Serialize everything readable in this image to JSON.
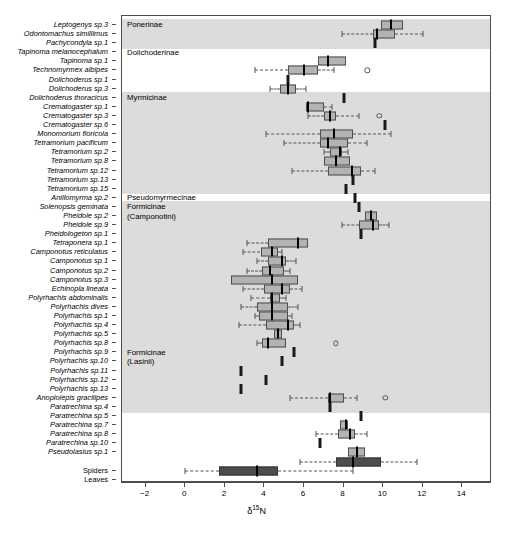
{
  "axis": {
    "x_title": "N",
    "x_title_prefix": "δ",
    "x_title_sup": "15",
    "x_ticks": [
      -2,
      0,
      2,
      4,
      6,
      8,
      10,
      12,
      14
    ],
    "x_tick_labels": [
      "−2",
      "0",
      "2",
      "4",
      "6",
      "8",
      "10",
      "12",
      "14"
    ],
    "x_min": -3.2,
    "x_max": 15.5
  },
  "groups": [
    {
      "name": "Ponerinae",
      "label": "Ponerinae",
      "shaded": true,
      "start": 0,
      "end": 2
    },
    {
      "name": "Dolichoderinae",
      "label": "Dolichoderinae",
      "shaded": false,
      "start": 3,
      "end": 7
    },
    {
      "name": "Myrmicinae",
      "label": "Myrmicinae",
      "shaded": true,
      "start": 8,
      "end": 18
    },
    {
      "name": "Pseudomyrmecinae",
      "label": "Pseudomyrmecinae",
      "shaded": false,
      "start": 19,
      "end": 19
    },
    {
      "name": "Formicinae-Camponotini",
      "label": "Formicinae\n(Camponotini)",
      "shaded": true,
      "start": 20,
      "end": 35
    },
    {
      "name": "Formicinae-Lasiini",
      "label": "Formicinae\n(Lasinii)",
      "shaded": true,
      "start": 36,
      "end": 42
    },
    {
      "name": "Other",
      "label": "",
      "shaded": false,
      "start": 43,
      "end": 44
    }
  ],
  "chart_data": {
    "type": "box",
    "title": "",
    "xlabel": "δ15N",
    "ylabel": "",
    "xlim": [
      -3.2,
      15.5
    ],
    "grid": false,
    "legend": "none",
    "orientation": "horizontal",
    "categories": [
      "Leptogenys sp.3",
      "Odontomachus simillimus",
      "Pachycondyla sp.1",
      "Tapinoma melanocephalum",
      "Tapinoma sp.1",
      "Technomyrmex albipes",
      "Dolichoderus sp.1",
      "Dolichoderus sp.3",
      "Dolichoderus thoracicus",
      "Crematogaster sp.1",
      "Crematogaster sp.3",
      "Crematogaster sp.6",
      "Monomorium floricola",
      "Tetramorium pacificum",
      "Tetramorium sp.2",
      "Tetramorium sp.8",
      "Tetramorium sp.12",
      "Tetramorium sp.13",
      "Tetramorium sp.15",
      "Anillomyrma sp.2",
      "Solenopsis geminata",
      "Pheidole sp.2",
      "Pheidole sp.9",
      "Pheidologeton sp.1",
      "Tetraponera sp.1",
      "Camponotus reticulatus",
      "Camponotus sp.1",
      "Camponotus sp.2",
      "Camponotus sp.3",
      "Echinopla lineata",
      "Polyrhachis abdominalis",
      "Polyrhachis dives",
      "Polyrhachis sp.1",
      "Polyrhachis sp.4",
      "Polyrhachis sp.5",
      "Polyrhachis sp.8",
      "Polyrhachis sp.9",
      "Polyrhachis sp.10",
      "Polyrhachis sp.11",
      "Polyrhachis sp.12",
      "Polyrhachis sp.13",
      "Anoplolepis gracilipes",
      "Paratrechina sp.4",
      "Paratrechina sp.5",
      "Paratrechina sp.7",
      "Paratrechina sp.8",
      "Paratrechina sp.10",
      "Pseudolasius sp.1",
      "",
      "Spiders",
      "Leaves"
    ],
    "category_italic": [
      true,
      true,
      true,
      true,
      true,
      true,
      true,
      true,
      true,
      true,
      true,
      true,
      true,
      true,
      true,
      true,
      true,
      true,
      true,
      true,
      true,
      true,
      true,
      true,
      true,
      true,
      true,
      true,
      true,
      true,
      true,
      true,
      true,
      true,
      true,
      true,
      true,
      true,
      true,
      true,
      true,
      true,
      true,
      true,
      true,
      true,
      true,
      true,
      false,
      false,
      false
    ],
    "boxes": [
      {
        "category": "Leptogenys sp.3",
        "q1": 9.9,
        "median": 10.4,
        "q3": 11.0,
        "lower": 9.9,
        "upper": 11.0,
        "outliers": [],
        "dark": false
      },
      {
        "category": "Odontomachus simillimus",
        "q1": 9.5,
        "median": 9.7,
        "q3": 10.6,
        "lower": 7.9,
        "upper": 12.0,
        "outliers": [],
        "dark": false
      },
      {
        "category": "Pachycondyla sp.1",
        "single": 9.6
      },
      {
        "category": "Tapinoma melanocephalum",
        "empty": true
      },
      {
        "category": "Tapinoma sp.1",
        "q1": 6.7,
        "median": 7.2,
        "q3": 8.1,
        "lower": 6.7,
        "upper": 8.1,
        "outliers": [],
        "dark": false
      },
      {
        "category": "Technomyrmex albipes",
        "q1": 5.2,
        "median": 6.0,
        "q3": 6.7,
        "lower": 3.5,
        "upper": 7.5,
        "outliers": [
          9.2
        ],
        "dark": false
      },
      {
        "category": "Dolichoderus sp.1",
        "single": 5.2
      },
      {
        "category": "Dolichoderus sp.3",
        "q1": 4.8,
        "median": 5.2,
        "q3": 5.6,
        "lower": 4.3,
        "upper": 6.1,
        "outliers": [],
        "dark": false
      },
      {
        "category": "Dolichoderus thoracicus",
        "single": 8.0
      },
      {
        "category": "Crematogaster sp.1",
        "q1": 6.1,
        "median": 6.2,
        "q3": 7.0,
        "lower": 6.1,
        "upper": 7.4,
        "outliers": [],
        "dark": false
      },
      {
        "category": "Crematogaster sp.3",
        "q1": 7.0,
        "median": 7.3,
        "q3": 7.6,
        "lower": 6.2,
        "upper": 8.8,
        "outliers": [
          9.8
        ],
        "dark": false
      },
      {
        "category": "Crematogaster sp.6",
        "single": 10.1
      },
      {
        "category": "Monomorium floricola",
        "q1": 6.8,
        "median": 7.5,
        "q3": 8.5,
        "lower": 4.1,
        "upper": 10.4,
        "outliers": [],
        "dark": false
      },
      {
        "category": "Tetramorium pacificum",
        "q1": 6.8,
        "median": 7.2,
        "q3": 8.2,
        "lower": 5.0,
        "upper": 9.2,
        "outliers": [],
        "dark": false
      },
      {
        "category": "Tetramorium sp.2",
        "q1": 7.3,
        "median": 7.8,
        "q3": 7.9,
        "lower": 7.0,
        "upper": 8.2,
        "outliers": [],
        "dark": false
      },
      {
        "category": "Tetramorium sp.8",
        "q1": 7.0,
        "median": 7.6,
        "q3": 8.3,
        "lower": 7.0,
        "upper": 8.3,
        "outliers": [],
        "dark": false
      },
      {
        "category": "Tetramorium sp.12",
        "q1": 7.2,
        "median": 8.4,
        "q3": 8.9,
        "lower": 5.4,
        "upper": 9.6,
        "outliers": [],
        "dark": false
      },
      {
        "category": "Tetramorium sp.13",
        "single": 8.5
      },
      {
        "category": "Tetramorium sp.15",
        "single": 8.1
      },
      {
        "category": "Anillomyrma sp.2",
        "single": 8.6
      },
      {
        "category": "Solenopsis geminata",
        "single": 8.8
      },
      {
        "category": "Pheidole sp.2",
        "q1": 9.1,
        "median": 9.4,
        "q3": 9.7,
        "lower": 9.1,
        "upper": 9.7,
        "outliers": [],
        "dark": false
      },
      {
        "category": "Pheidole sp.9",
        "q1": 8.8,
        "median": 9.5,
        "q3": 9.8,
        "lower": 7.9,
        "upper": 10.3,
        "outliers": [],
        "dark": false
      },
      {
        "category": "Pheidologeton sp.1",
        "single": 8.9
      },
      {
        "category": "Tetraponera sp.1",
        "q1": 4.2,
        "median": 5.7,
        "q3": 6.2,
        "lower": 3.1,
        "upper": 6.2,
        "outliers": [],
        "dark": false
      },
      {
        "category": "Camponotus reticulatus",
        "q1": 3.8,
        "median": 4.4,
        "q3": 4.7,
        "lower": 2.9,
        "upper": 4.9,
        "outliers": [],
        "dark": false
      },
      {
        "category": "Camponotus sp.1",
        "q1": 4.2,
        "median": 4.9,
        "q3": 5.1,
        "lower": 3.6,
        "upper": 5.6,
        "outliers": [],
        "dark": false
      },
      {
        "category": "Camponotus sp.2",
        "q1": 3.9,
        "median": 4.3,
        "q3": 5.0,
        "lower": 3.1,
        "upper": 5.3,
        "outliers": [],
        "dark": false
      },
      {
        "category": "Camponotus sp.3",
        "q1": 2.3,
        "median": 4.4,
        "q3": 5.7,
        "lower": 2.3,
        "upper": 5.7,
        "outliers": [],
        "dark": false
      },
      {
        "category": "Echinopla lineata",
        "q1": 4.0,
        "median": 4.9,
        "q3": 5.3,
        "lower": 2.9,
        "upper": 5.9,
        "outliers": [],
        "dark": false
      },
      {
        "category": "Polyrhachis abdominalis",
        "q1": 4.3,
        "median": 4.4,
        "q3": 4.8,
        "lower": 3.3,
        "upper": 5.1,
        "outliers": [],
        "dark": false
      },
      {
        "category": "Polyrhachis dives",
        "q1": 3.6,
        "median": 4.4,
        "q3": 5.2,
        "lower": 2.8,
        "upper": 5.7,
        "outliers": [],
        "dark": false
      },
      {
        "category": "Polyrhachis sp.1",
        "q1": 3.7,
        "median": 4.4,
        "q3": 5.2,
        "lower": 3.5,
        "upper": 5.4,
        "outliers": [],
        "dark": false
      },
      {
        "category": "Polyrhachis sp.4",
        "q1": 4.1,
        "median": 5.2,
        "q3": 5.5,
        "lower": 2.7,
        "upper": 5.8,
        "outliers": [],
        "dark": false
      },
      {
        "category": "Polyrhachis sp.5",
        "q1": 4.5,
        "median": 4.7,
        "q3": 4.9,
        "lower": 4.5,
        "upper": 4.9,
        "outliers": [],
        "dark": false
      },
      {
        "category": "Polyrhachis sp.8",
        "q1": 3.9,
        "median": 4.2,
        "q3": 5.1,
        "lower": 3.6,
        "upper": 5.1,
        "outliers": [
          7.6
        ],
        "dark": false
      },
      {
        "category": "Polyrhachis sp.9",
        "single": 5.5
      },
      {
        "category": "Polyrhachis sp.10",
        "single": 4.9
      },
      {
        "category": "Polyrhachis sp.11",
        "single": 2.8
      },
      {
        "category": "Polyrhachis sp.12",
        "single": 4.1
      },
      {
        "category": "Polyrhachis sp.13",
        "single": 2.8
      },
      {
        "category": "Anoplolepis gracilipes",
        "q1": 7.2,
        "median": 7.3,
        "q3": 8.0,
        "lower": 5.3,
        "upper": 8.7,
        "outliers": [
          10.1
        ],
        "dark": false
      },
      {
        "category": "Paratrechina sp.4",
        "single": 7.3
      },
      {
        "category": "Paratrechina sp.5",
        "single": 8.9
      },
      {
        "category": "Paratrechina sp.7",
        "q1": 7.8,
        "median": 8.1,
        "q3": 8.2,
        "lower": 7.8,
        "upper": 8.2,
        "outliers": [],
        "dark": false
      },
      {
        "category": "Paratrechina sp.8",
        "q1": 7.7,
        "median": 8.3,
        "q3": 8.6,
        "lower": 6.6,
        "upper": 9.2,
        "outliers": [],
        "dark": false
      },
      {
        "category": "Paratrechina sp.10",
        "single": 6.8
      },
      {
        "category": "Pseudolasius sp.1",
        "q1": 8.2,
        "median": 8.7,
        "q3": 9.1,
        "lower": 8.2,
        "upper": 9.1,
        "outliers": [],
        "dark": false
      },
      {
        "category": "Spiders",
        "q1": 7.6,
        "median": 8.5,
        "q3": 9.9,
        "lower": 5.8,
        "upper": 11.7,
        "outliers": [],
        "dark": true
      },
      {
        "category": "Leaves",
        "q1": 1.7,
        "median": 3.6,
        "q3": 4.7,
        "lower": 0.0,
        "upper": 8.5,
        "outliers": [],
        "dark": true
      }
    ]
  }
}
